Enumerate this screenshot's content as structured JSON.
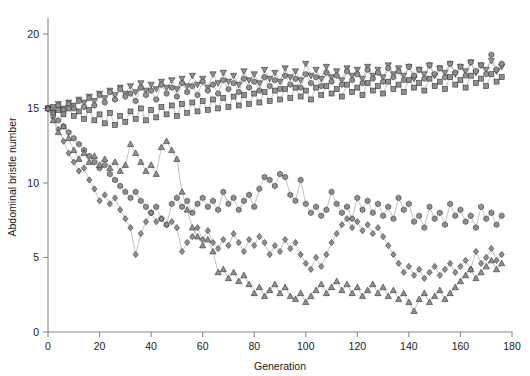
{
  "figure": {
    "background": "#ffffff",
    "line_color": "#9a9a9a",
    "marker_fill": "#8f8f8f",
    "marker_stroke": "#2a2a2a",
    "axis_color": "#8a8a8a"
  },
  "caption": {
    "text": ""
  },
  "chart_data": {
    "type": "line",
    "title": "",
    "subtitle": "",
    "xlabel": "Generation",
    "ylabel": "Abdominal bristle number",
    "xlim": [
      0,
      180
    ],
    "ylim": [
      0,
      20.8
    ],
    "xticks": [
      0,
      20,
      40,
      60,
      80,
      100,
      120,
      140,
      160,
      180
    ],
    "yticks": [
      0,
      5,
      10,
      15,
      20
    ],
    "grid": false,
    "legend": "none",
    "annotations": [],
    "series": [
      {
        "name": "High line 1",
        "marker": "triangle-down",
        "direction": "up-selected",
        "x": [
          0,
          2,
          4,
          6,
          8,
          10,
          12,
          14,
          16,
          18,
          20,
          22,
          24,
          26,
          28,
          30,
          32,
          34,
          36,
          38,
          40,
          42,
          44,
          46,
          48,
          50,
          52,
          54,
          56,
          58,
          60,
          62,
          64,
          66,
          68,
          70,
          72,
          74,
          76,
          78,
          80,
          82,
          84,
          86,
          88,
          90,
          92,
          94,
          96,
          98,
          100,
          102,
          104,
          106,
          108,
          110,
          112,
          114,
          116,
          118,
          120,
          122,
          124,
          126,
          128,
          130,
          132,
          134,
          136,
          138,
          140,
          142,
          144,
          146,
          148,
          150,
          152,
          154,
          156,
          158,
          160,
          162,
          164,
          166,
          168,
          170,
          172,
          174,
          176
        ],
        "values": [
          15.0,
          15.1,
          15.3,
          15.0,
          15.4,
          15.2,
          15.6,
          15.4,
          15.8,
          15.5,
          16.0,
          15.7,
          16.2,
          15.9,
          16.4,
          16.0,
          16.5,
          16.1,
          16.7,
          16.2,
          16.6,
          16.3,
          16.8,
          16.4,
          16.9,
          16.3,
          17.0,
          16.5,
          17.2,
          16.6,
          17.0,
          16.4,
          17.3,
          16.7,
          17.4,
          16.8,
          17.2,
          16.6,
          17.5,
          16.9,
          17.3,
          16.7,
          17.6,
          17.0,
          17.4,
          16.8,
          17.7,
          17.1,
          17.5,
          16.9,
          18.0,
          17.2,
          17.6,
          17.0,
          17.8,
          17.1,
          17.5,
          16.9,
          17.7,
          17.2,
          17.6,
          17.0,
          17.8,
          17.2,
          17.6,
          17.1,
          17.9,
          17.3,
          17.7,
          17.2,
          17.8,
          17.0,
          17.6,
          17.3,
          17.9,
          17.2,
          17.7,
          17.4,
          18.0,
          17.3,
          17.8,
          17.5,
          18.1,
          17.4,
          17.9,
          17.6,
          18.2,
          17.5,
          17.8
        ]
      },
      {
        "name": "High line 2",
        "marker": "hexagon",
        "direction": "up-selected",
        "x": [
          0,
          2,
          4,
          6,
          8,
          10,
          12,
          14,
          16,
          18,
          20,
          22,
          24,
          26,
          28,
          30,
          32,
          34,
          36,
          38,
          40,
          42,
          44,
          46,
          48,
          50,
          52,
          54,
          56,
          58,
          60,
          62,
          64,
          66,
          68,
          70,
          72,
          74,
          76,
          78,
          80,
          82,
          84,
          86,
          88,
          90,
          92,
          94,
          96,
          98,
          100,
          102,
          104,
          106,
          108,
          110,
          112,
          114,
          116,
          118,
          120,
          122,
          124,
          126,
          128,
          130,
          132,
          134,
          136,
          138,
          140,
          142,
          144,
          146,
          148,
          150,
          152,
          154,
          156,
          158,
          160,
          162,
          164,
          166,
          168,
          170,
          172,
          174,
          176
        ],
        "values": [
          15.0,
          14.8,
          15.2,
          14.9,
          15.3,
          15.0,
          15.5,
          15.1,
          15.7,
          15.2,
          15.9,
          15.4,
          16.1,
          15.6,
          16.3,
          15.8,
          16.0,
          15.5,
          16.4,
          15.9,
          16.2,
          15.6,
          16.6,
          16.0,
          16.4,
          15.8,
          16.7,
          16.1,
          16.5,
          15.9,
          16.8,
          16.2,
          16.6,
          16.0,
          16.9,
          16.3,
          16.7,
          16.1,
          17.0,
          16.4,
          16.8,
          16.2,
          17.1,
          16.5,
          16.9,
          16.3,
          17.2,
          16.6,
          17.0,
          16.4,
          17.3,
          16.7,
          17.1,
          16.5,
          17.4,
          16.8,
          17.2,
          16.6,
          17.5,
          16.9,
          17.3,
          16.7,
          17.6,
          17.0,
          17.4,
          16.8,
          17.7,
          17.1,
          17.5,
          16.9,
          17.8,
          17.2,
          17.6,
          17.0,
          17.9,
          17.3,
          17.7,
          17.1,
          18.0,
          17.4,
          17.8,
          17.2,
          18.1,
          17.5,
          17.9,
          17.3,
          18.6,
          17.6,
          18.0
        ]
      },
      {
        "name": "High line 3",
        "marker": "square",
        "direction": "up-selected",
        "x": [
          0,
          2,
          4,
          6,
          8,
          10,
          12,
          14,
          16,
          18,
          20,
          22,
          24,
          26,
          28,
          30,
          32,
          34,
          36,
          38,
          40,
          42,
          44,
          46,
          48,
          50,
          52,
          54,
          56,
          58,
          60,
          62,
          64,
          66,
          68,
          70,
          72,
          74,
          76,
          78,
          80,
          82,
          84,
          86,
          88,
          90,
          92,
          94,
          96,
          98,
          100,
          102,
          104,
          106,
          108,
          110,
          112,
          114,
          116,
          118,
          120,
          122,
          124,
          126,
          128,
          130,
          132,
          134,
          136,
          138,
          140,
          142,
          144,
          146,
          148,
          150,
          152,
          154,
          156,
          158,
          160,
          162,
          164,
          166,
          168,
          170,
          172,
          174,
          176
        ],
        "values": [
          15.0,
          14.7,
          14.9,
          14.6,
          15.0,
          14.5,
          14.8,
          14.3,
          14.9,
          14.2,
          14.6,
          14.0,
          14.7,
          13.9,
          14.5,
          14.1,
          14.8,
          14.3,
          15.0,
          14.2,
          14.9,
          14.4,
          15.1,
          14.6,
          15.2,
          14.5,
          15.3,
          14.7,
          15.4,
          14.8,
          15.5,
          14.9,
          15.6,
          15.0,
          15.7,
          15.1,
          15.8,
          15.2,
          15.9,
          15.3,
          16.0,
          15.4,
          16.1,
          15.5,
          16.2,
          15.6,
          16.3,
          15.7,
          16.4,
          15.8,
          16.2,
          15.6,
          16.4,
          15.9,
          16.5,
          16.0,
          16.3,
          15.8,
          16.6,
          16.1,
          16.4,
          15.9,
          16.7,
          16.2,
          16.5,
          16.0,
          16.8,
          16.3,
          16.6,
          16.1,
          16.9,
          16.4,
          16.7,
          16.2,
          17.0,
          16.5,
          16.8,
          16.3,
          17.1,
          16.6,
          16.9,
          16.4,
          17.2,
          16.7,
          17.0,
          16.5,
          17.3,
          16.8,
          17.1
        ]
      },
      {
        "name": "Low line 1",
        "marker": "hexagon",
        "direction": "down-selected",
        "x": [
          0,
          2,
          4,
          6,
          8,
          10,
          12,
          14,
          16,
          18,
          20,
          22,
          24,
          26,
          28,
          30,
          32,
          34,
          36,
          38,
          40,
          42,
          44,
          46,
          48,
          50,
          52,
          54,
          56,
          58,
          60,
          62,
          64,
          66,
          68,
          70,
          72,
          74,
          76,
          78,
          80,
          82,
          84,
          86,
          88,
          90,
          92,
          94,
          96,
          98,
          100,
          102,
          104,
          106,
          108,
          110,
          112,
          114,
          116,
          118,
          120,
          122,
          124,
          126,
          128,
          130,
          132,
          134,
          136,
          138,
          140,
          142,
          144,
          146,
          148,
          150,
          152,
          154,
          156,
          158,
          160,
          162,
          164,
          166,
          168,
          170,
          172,
          174,
          176
        ],
        "values": [
          15.0,
          14.6,
          14.2,
          13.8,
          13.4,
          13.0,
          12.6,
          12.2,
          11.8,
          11.4,
          11.0,
          11.2,
          10.6,
          10.2,
          9.8,
          9.4,
          9.0,
          9.4,
          8.8,
          8.4,
          8.0,
          8.4,
          7.6,
          7.2,
          8.6,
          9.0,
          8.4,
          8.8,
          8.0,
          8.6,
          9.0,
          8.4,
          8.8,
          8.2,
          9.4,
          8.6,
          9.0,
          8.2,
          8.8,
          9.2,
          8.4,
          9.6,
          10.4,
          10.2,
          9.8,
          10.6,
          10.4,
          9.2,
          8.8,
          10.2,
          8.6,
          8.0,
          8.4,
          7.8,
          8.2,
          9.4,
          8.6,
          8.0,
          8.4,
          7.6,
          9.0,
          8.2,
          8.8,
          8.0,
          8.6,
          7.8,
          8.4,
          7.6,
          9.0,
          8.2,
          8.6,
          7.4,
          7.8,
          7.0,
          8.4,
          7.6,
          8.0,
          7.2,
          8.6,
          7.8,
          8.2,
          7.4,
          7.8,
          7.0,
          8.4,
          7.6,
          8.0,
          7.2,
          7.8
        ]
      },
      {
        "name": "Low line 2",
        "marker": "diamond",
        "direction": "down-selected",
        "x": [
          0,
          2,
          4,
          6,
          8,
          10,
          12,
          14,
          16,
          18,
          20,
          22,
          24,
          26,
          28,
          30,
          32,
          34,
          36,
          38,
          40,
          42,
          44,
          46,
          48,
          50,
          52,
          54,
          56,
          58,
          60,
          62,
          64,
          66,
          68,
          70,
          72,
          74,
          76,
          78,
          80,
          82,
          84,
          86,
          88,
          90,
          92,
          94,
          96,
          98,
          100,
          102,
          104,
          106,
          108,
          110,
          112,
          114,
          116,
          118,
          120,
          122,
          124,
          126,
          128,
          130,
          132,
          134,
          136,
          138,
          140,
          142,
          144,
          146,
          148,
          150,
          152,
          154,
          156,
          158,
          160,
          162,
          164,
          166,
          168,
          170,
          172,
          174,
          176
        ],
        "values": [
          15.0,
          14.4,
          13.6,
          12.8,
          12.0,
          11.4,
          10.8,
          11.0,
          10.2,
          9.6,
          8.8,
          9.2,
          8.6,
          9.0,
          8.2,
          7.6,
          7.0,
          5.2,
          6.6,
          7.4,
          8.0,
          7.4,
          7.6,
          7.2,
          7.4,
          7.0,
          5.4,
          6.0,
          6.4,
          7.0,
          6.2,
          6.8,
          6.0,
          5.6,
          6.2,
          5.8,
          6.6,
          6.0,
          5.4,
          6.2,
          5.8,
          6.4,
          6.0,
          5.2,
          5.8,
          5.4,
          6.2,
          5.6,
          6.0,
          5.2,
          4.6,
          4.2,
          5.0,
          4.4,
          5.2,
          6.0,
          6.6,
          7.2,
          7.6,
          7.0,
          7.4,
          6.8,
          7.2,
          6.6,
          7.0,
          6.4,
          5.8,
          5.2,
          4.6,
          4.0,
          4.4,
          3.8,
          4.2,
          3.6,
          4.0,
          4.4,
          3.8,
          4.2,
          4.6,
          4.0,
          4.4,
          4.8,
          4.2,
          5.4,
          4.6,
          5.0,
          5.6,
          4.8,
          5.2
        ]
      },
      {
        "name": "Low line 3",
        "marker": "triangle-up",
        "direction": "down-selected",
        "x": [
          0,
          2,
          4,
          6,
          8,
          10,
          12,
          14,
          16,
          18,
          20,
          22,
          24,
          26,
          28,
          30,
          32,
          34,
          36,
          38,
          40,
          42,
          44,
          46,
          48,
          50,
          52,
          54,
          56,
          58,
          60,
          62,
          64,
          66,
          68,
          70,
          72,
          74,
          76,
          78,
          80,
          82,
          84,
          86,
          88,
          90,
          92,
          94,
          96,
          98,
          100,
          102,
          104,
          106,
          108,
          110,
          112,
          114,
          116,
          118,
          120,
          122,
          124,
          126,
          128,
          130,
          132,
          134,
          136,
          138,
          140,
          142,
          144,
          146,
          148,
          150,
          152,
          154,
          156,
          158,
          160,
          162,
          164,
          166,
          168,
          170,
          172,
          174,
          176
        ],
        "values": [
          15.0,
          14.2,
          13.4,
          13.8,
          13.0,
          12.2,
          11.6,
          12.0,
          11.4,
          11.8,
          11.2,
          11.6,
          11.0,
          11.4,
          10.8,
          11.2,
          12.6,
          12.0,
          11.4,
          10.8,
          11.2,
          10.6,
          12.4,
          12.8,
          12.2,
          11.6,
          9.4,
          8.2,
          7.0,
          6.4,
          5.8,
          6.2,
          5.4,
          4.0,
          4.2,
          3.6,
          4.0,
          3.4,
          3.8,
          3.2,
          2.6,
          3.0,
          2.4,
          2.8,
          3.2,
          2.6,
          3.0,
          2.4,
          2.2,
          2.6,
          2.0,
          2.4,
          2.8,
          3.2,
          2.6,
          3.0,
          3.4,
          2.8,
          3.2,
          2.6,
          3.0,
          2.4,
          2.8,
          3.2,
          2.6,
          3.0,
          2.4,
          2.8,
          2.2,
          2.6,
          2.0,
          1.4,
          2.2,
          2.6,
          2.0,
          2.4,
          2.8,
          2.2,
          2.6,
          3.0,
          3.4,
          3.8,
          4.2,
          3.6,
          4.0,
          4.4,
          4.8,
          4.2,
          4.6
        ]
      }
    ]
  }
}
